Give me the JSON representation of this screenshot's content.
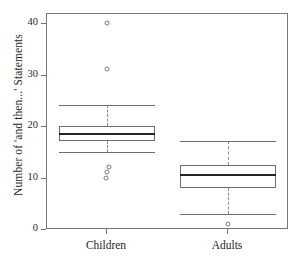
{
  "chart_data": {
    "type": "box",
    "title": "",
    "xlabel": "",
    "ylabel": "Number of 'and then...' Statements",
    "categories": [
      "Children",
      "Adults"
    ],
    "ylim": [
      0,
      41
    ],
    "yticks": [
      0,
      10,
      20,
      30,
      40
    ],
    "ytick_labels": [
      "0",
      "10",
      "20",
      "30",
      "40"
    ],
    "grid": false,
    "legend": "none",
    "series": [
      {
        "name": "Children",
        "min_whisker": 15,
        "q1": 17,
        "median": 18.5,
        "q3": 20,
        "max_whisker": 24,
        "outliers": [
          40,
          31,
          12,
          11,
          10
        ]
      },
      {
        "name": "Adults",
        "min_whisker": 3,
        "q1": 8,
        "median": 10.5,
        "q3": 12.5,
        "max_whisker": 17,
        "outliers": [
          1
        ]
      }
    ]
  },
  "axis": {
    "y_label_text": "Number of 'and then...' Statements",
    "tick_0": "0",
    "tick_10": "10",
    "tick_20": "20",
    "tick_30": "30",
    "tick_40": "40",
    "x_label_children": "Children",
    "x_label_adults": "Adults"
  },
  "colors": {
    "frame": "#777777",
    "box_stroke": "#6d6d6d",
    "median_stroke": "#252525",
    "whisker_stroke": "#8a8a8a",
    "outlier_stroke": "#7a7a7a",
    "text": "#1f1f1f",
    "background": "#ffffff"
  }
}
